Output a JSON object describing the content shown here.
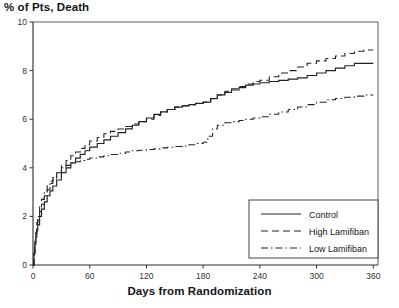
{
  "chart_data": {
    "type": "line",
    "title": "% of Pts, Death",
    "xlabel": "Days from Randomization",
    "ylabel": "% of Pts, Death",
    "xlim": [
      0,
      365
    ],
    "ylim": [
      0,
      10
    ],
    "xticks": [
      0,
      60,
      120,
      180,
      240,
      300,
      360
    ],
    "yticks": [
      0,
      2,
      4,
      6,
      8,
      10
    ],
    "grid": false,
    "legend_position": "bottom-right",
    "style": "kaplan-meier step curves",
    "series": [
      {
        "name": "Control",
        "linestyle": "solid",
        "color": "#222222",
        "x": [
          0,
          1,
          2,
          3,
          4,
          5,
          7,
          9,
          12,
          15,
          18,
          21,
          25,
          30,
          35,
          40,
          45,
          50,
          55,
          60,
          68,
          75,
          82,
          90,
          98,
          105,
          112,
          120,
          128,
          135,
          142,
          150,
          158,
          165,
          172,
          180,
          188,
          195,
          203,
          210,
          218,
          225,
          233,
          240,
          250,
          260,
          270,
          280,
          290,
          300,
          310,
          320,
          330,
          340,
          350,
          360
        ],
        "y": [
          0,
          0.45,
          0.85,
          1.15,
          1.4,
          1.65,
          2.0,
          2.3,
          2.6,
          2.85,
          3.05,
          3.25,
          3.5,
          3.8,
          4.0,
          4.2,
          4.4,
          4.55,
          4.7,
          4.85,
          5.0,
          5.15,
          5.3,
          5.45,
          5.6,
          5.75,
          5.9,
          6.05,
          6.2,
          6.3,
          6.4,
          6.5,
          6.55,
          6.6,
          6.65,
          6.7,
          6.85,
          7.0,
          7.1,
          7.2,
          7.3,
          7.4,
          7.45,
          7.5,
          7.55,
          7.6,
          7.65,
          7.7,
          7.8,
          7.9,
          8.0,
          8.1,
          8.2,
          8.3,
          8.3,
          8.3
        ]
      },
      {
        "name": "High Lamifiban",
        "linestyle": "dashed",
        "color": "#222222",
        "x": [
          0,
          1,
          2,
          3,
          4,
          5,
          7,
          9,
          12,
          15,
          18,
          21,
          25,
          30,
          35,
          40,
          45,
          50,
          55,
          60,
          68,
          75,
          82,
          90,
          98,
          105,
          112,
          120,
          128,
          135,
          142,
          150,
          158,
          165,
          172,
          180,
          188,
          195,
          203,
          210,
          218,
          225,
          233,
          240,
          250,
          260,
          270,
          280,
          290,
          300,
          310,
          320,
          330,
          340,
          350,
          360
        ],
        "y": [
          0,
          0.5,
          0.95,
          1.3,
          1.6,
          1.85,
          2.2,
          2.5,
          2.85,
          3.1,
          3.35,
          3.55,
          3.8,
          4.1,
          4.3,
          4.5,
          4.65,
          4.8,
          4.95,
          5.1,
          5.25,
          5.4,
          5.5,
          5.6,
          5.7,
          5.8,
          5.9,
          6.0,
          6.15,
          6.3,
          6.4,
          6.5,
          6.55,
          6.6,
          6.65,
          6.7,
          6.85,
          7.0,
          7.15,
          7.25,
          7.35,
          7.45,
          7.55,
          7.6,
          7.75,
          7.9,
          8.0,
          8.15,
          8.3,
          8.4,
          8.5,
          8.6,
          8.7,
          8.8,
          8.85,
          8.85
        ]
      },
      {
        "name": "Low Lamifiban",
        "linestyle": "dashdot",
        "color": "#222222",
        "x": [
          0,
          1,
          2,
          3,
          4,
          5,
          7,
          9,
          12,
          15,
          18,
          21,
          25,
          30,
          35,
          40,
          45,
          50,
          55,
          60,
          68,
          75,
          82,
          90,
          98,
          105,
          112,
          120,
          128,
          135,
          142,
          150,
          158,
          165,
          172,
          180,
          185,
          190,
          195,
          203,
          210,
          218,
          225,
          233,
          240,
          250,
          260,
          270,
          280,
          290,
          300,
          310,
          320,
          330,
          340,
          350,
          360
        ],
        "y": [
          0,
          0.55,
          1.05,
          1.45,
          1.75,
          2.0,
          2.4,
          2.7,
          3.0,
          3.25,
          3.45,
          3.6,
          3.8,
          4.0,
          4.1,
          4.2,
          4.25,
          4.3,
          4.35,
          4.4,
          4.45,
          4.5,
          4.55,
          4.6,
          4.65,
          4.7,
          4.72,
          4.75,
          4.78,
          4.82,
          4.85,
          4.88,
          4.9,
          4.95,
          5.0,
          5.05,
          5.3,
          5.6,
          5.75,
          5.85,
          5.9,
          5.95,
          6.0,
          6.05,
          6.1,
          6.2,
          6.3,
          6.4,
          6.5,
          6.6,
          6.7,
          6.8,
          6.85,
          6.9,
          6.95,
          7.0,
          7.0
        ]
      }
    ]
  },
  "legend": {
    "entries": [
      {
        "label": "Control",
        "style": "solid"
      },
      {
        "label": "High Lamifiban",
        "style": "dashed"
      },
      {
        "label": "Low Lamifiban",
        "style": "dashdot"
      }
    ]
  },
  "axis": {
    "y_tick_labels": [
      "10",
      "8",
      "6",
      "4",
      "2",
      "0"
    ],
    "x_tick_labels": [
      "0",
      "60",
      "120",
      "180",
      "240",
      "300",
      "360"
    ]
  },
  "colors": {
    "line": "#222222",
    "axis": "#4a4a4a",
    "text": "#141414"
  }
}
